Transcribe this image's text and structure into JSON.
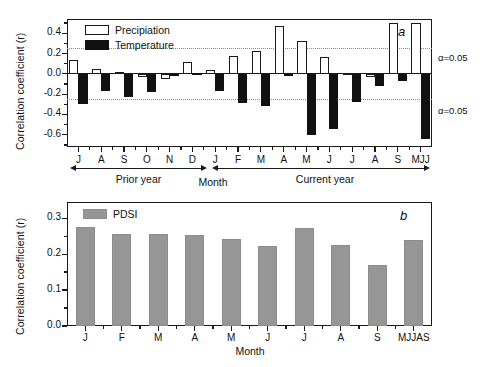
{
  "figure": {
    "y_axis_label": "Correlation coefficient (r)",
    "x_axis_label": "Month"
  },
  "panel_a": {
    "letter": "a",
    "legend": [
      {
        "key": "precipitation",
        "label": "Precipiation",
        "swatch": "white-open-rectangle"
      },
      {
        "key": "temperature",
        "label": "Temperature",
        "swatch": "black-filled-rectangle"
      }
    ],
    "significance": {
      "upper_label": "α=0.05",
      "lower_label": "α=0.05",
      "upper_value": 0.25,
      "lower_value": -0.25
    },
    "span_prior": "Prior year",
    "span_current": "Current year"
  },
  "panel_b": {
    "letter": "b",
    "legend": [
      {
        "key": "pdsi",
        "label": "PDSI",
        "swatch": "gray-filled-rectangle"
      }
    ]
  },
  "colors": {
    "precipitation": "#ffffff",
    "temperature": "#111111",
    "pdsi": "#969696",
    "axis": "#1a1a1a",
    "significance_line": "#8a8a8a"
  },
  "chart_data": [
    {
      "type": "bar",
      "panel": "a",
      "title": "a",
      "xlabel": "Month",
      "ylabel": "Correlation coefficient (r)",
      "ylim": [
        -0.72,
        0.54
      ],
      "yticks": [
        0.4,
        0.2,
        0.0,
        -0.2,
        -0.4,
        -0.6
      ],
      "ytick_labels": [
        "0.4",
        "0.2",
        "0.0",
        "-0.2",
        "-0.4",
        "-0.6"
      ],
      "grid": false,
      "legend_position": "top-left",
      "categories": [
        "J",
        "A",
        "S",
        "O",
        "N",
        "D",
        "J",
        "F",
        "M",
        "A",
        "M",
        "J",
        "J",
        "A",
        "S",
        "MJJ"
      ],
      "category_groups": [
        {
          "name": "Prior year",
          "labels": [
            "J",
            "A",
            "S",
            "O",
            "N",
            "D"
          ]
        },
        {
          "name": "Current year",
          "labels": [
            "J",
            "F",
            "M",
            "A",
            "M",
            "J",
            "J",
            "A",
            "S",
            "MJJ"
          ]
        }
      ],
      "series": [
        {
          "name": "Precipiation",
          "values": [
            0.135,
            0.045,
            0.015,
            -0.035,
            -0.055,
            0.115,
            0.04,
            0.175,
            0.225,
            0.475,
            0.325,
            0.17,
            0.01,
            -0.03,
            0.5,
            0.5
          ]
        },
        {
          "name": "Temperature",
          "values": [
            -0.295,
            -0.17,
            -0.225,
            -0.175,
            -0.015,
            0.01,
            -0.165,
            -0.285,
            -0.315,
            -0.01,
            -0.6,
            -0.545,
            -0.275,
            -0.115,
            -0.075,
            -0.64
          ]
        }
      ],
      "annotations": [
        {
          "text": "α=0.05",
          "y": 0.25,
          "position": "right-outside"
        },
        {
          "text": "α=0.05",
          "y": -0.25,
          "position": "right-outside"
        }
      ],
      "reference_lines": [
        0.25,
        -0.25
      ]
    },
    {
      "type": "bar",
      "panel": "b",
      "title": "b",
      "xlabel": "Month",
      "ylabel": "Correlation coefficient (r)",
      "ylim": [
        0.0,
        0.345
      ],
      "yticks": [
        0.0,
        0.1,
        0.2,
        0.3
      ],
      "ytick_labels": [
        "0.0",
        "0.1",
        "0.2",
        "0.3"
      ],
      "grid": false,
      "legend_position": "top-left",
      "categories": [
        "J",
        "F",
        "M",
        "A",
        "M",
        "J",
        "J",
        "A",
        "S",
        "MJJAS"
      ],
      "series": [
        {
          "name": "PDSI",
          "values": [
            0.275,
            0.255,
            0.257,
            0.253,
            0.242,
            0.222,
            0.273,
            0.224,
            0.17,
            0.239
          ]
        }
      ]
    }
  ]
}
